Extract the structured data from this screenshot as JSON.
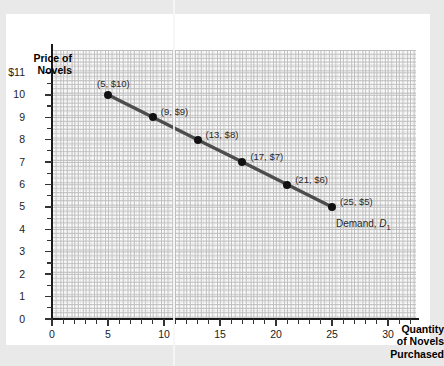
{
  "chart_data": {
    "type": "line",
    "title": "",
    "xlabel": "Quantity of Novels Purchased",
    "ylabel": "Price of Novels",
    "xlim": [
      0,
      32.5
    ],
    "ylim": [
      0,
      12
    ],
    "grid": true,
    "legend_position": "inline-right",
    "x_major_ticks": [
      0,
      5,
      10,
      15,
      20,
      25,
      30
    ],
    "x_tick_labels": [
      "0",
      "5",
      "10",
      "15",
      "20",
      "25",
      "30"
    ],
    "y_major_ticks": [
      0,
      1,
      2,
      3,
      4,
      5,
      6,
      7,
      8,
      9,
      10,
      11
    ],
    "y_tick_labels": [
      "0",
      "1",
      "2",
      "3",
      "4",
      "5",
      "6",
      "7",
      "8",
      "9",
      "10",
      "$11"
    ],
    "series": [
      {
        "name": "Demand, D1",
        "label_text": "Demand, ",
        "label_symbol": "D",
        "label_subscript": "1",
        "color": "#4d4d4d",
        "marker_color": "#111111",
        "x": [
          5,
          9,
          13,
          17,
          21,
          25
        ],
        "y": [
          10,
          9,
          8,
          7,
          6,
          5
        ],
        "point_labels": [
          "(5, $10)",
          "(9, $9)",
          "(13, $8)",
          "(17, $7)",
          "(21, $6)",
          "(25, $5)"
        ]
      }
    ]
  },
  "axes": {
    "y_title_line1": "Price of",
    "y_title_line2": "Novels",
    "x_title_line1": "Quantity",
    "x_title_line2": "of Novels",
    "x_title_line3": "Purchased"
  },
  "colors": {
    "page_background": "#e9e9e9",
    "card_background": "#ffffff",
    "axis": "#1a1a1a",
    "grid_minor": "#d8d8d8",
    "grid_major": "#9a9a9a",
    "line": "#4d4d4d",
    "marker": "#111111",
    "text": "#1c1c1c"
  }
}
